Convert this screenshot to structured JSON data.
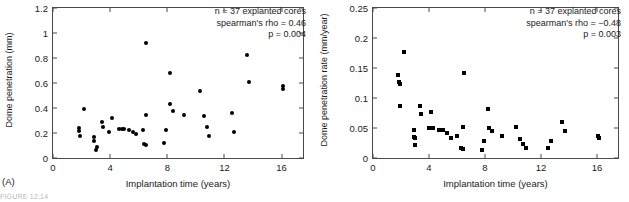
{
  "figure": {
    "caption_partial": "FIGURE 12.14"
  },
  "panels": [
    {
      "tag": "(A)",
      "xlabel": "Implantation time (years)",
      "ylabel": "Dome penetration (mm)",
      "stats": {
        "n_line": "n = 37 explanted cores",
        "rho_line": "spearman's rho = 0.46",
        "p_line": "p = 0.004"
      }
    },
    {
      "tag": "(B)",
      "xlabel": "Implantation time (years)",
      "ylabel": "Dome penetration rate (mm/year)",
      "stats": {
        "n_line": "n = 37 explanted cores",
        "rho_line": "spearman's rho = −0.48",
        "p_line": "p = 0.003"
      }
    }
  ],
  "chart_data": [
    {
      "type": "scatter",
      "panel": "A",
      "title": "",
      "xlabel": "Implantation time (years)",
      "ylabel": "Dome penetration (mm)",
      "xlim": [
        0,
        17.5
      ],
      "ylim": [
        0,
        1.2
      ],
      "xticks": [
        0,
        4,
        8,
        12,
        16
      ],
      "yticks": [
        0,
        0.2,
        0.4,
        0.6,
        0.8,
        1,
        1.2
      ],
      "ytick_labels": [
        "0",
        "0.2",
        "0.4",
        "0.6",
        "0.8",
        "1",
        "1.2"
      ],
      "grid": false,
      "marker": "circle",
      "marker_color": "#000000",
      "n": 37,
      "spearman_rho": 0.46,
      "p_value": 0.004,
      "points": [
        [
          1.8,
          0.24
        ],
        [
          1.8,
          0.22
        ],
        [
          1.9,
          0.175
        ],
        [
          2.2,
          0.395
        ],
        [
          2.9,
          0.165
        ],
        [
          2.9,
          0.14
        ],
        [
          3.0,
          0.065
        ],
        [
          3.1,
          0.085
        ],
        [
          3.4,
          0.29
        ],
        [
          3.5,
          0.245
        ],
        [
          3.9,
          0.205
        ],
        [
          4.1,
          0.32
        ],
        [
          4.6,
          0.23
        ],
        [
          4.8,
          0.235
        ],
        [
          5.0,
          0.23
        ],
        [
          5.3,
          0.225
        ],
        [
          5.6,
          0.205
        ],
        [
          5.8,
          0.19
        ],
        [
          6.3,
          0.225
        ],
        [
          6.4,
          0.115
        ],
        [
          6.5,
          0.105
        ],
        [
          6.5,
          0.345
        ],
        [
          7.8,
          0.12
        ],
        [
          7.9,
          0.225
        ],
        [
          8.2,
          0.43
        ],
        [
          8.2,
          0.68
        ],
        [
          8.4,
          0.375
        ],
        [
          6.5,
          0.92
        ],
        [
          9.2,
          0.345
        ],
        [
          10.3,
          0.54
        ],
        [
          10.6,
          0.335
        ],
        [
          10.8,
          0.245
        ],
        [
          10.9,
          0.18
        ],
        [
          12.5,
          0.36
        ],
        [
          12.7,
          0.21
        ],
        [
          13.6,
          0.825
        ],
        [
          13.7,
          0.61
        ],
        [
          16.1,
          0.58
        ],
        [
          16.1,
          0.55
        ]
      ]
    },
    {
      "type": "scatter",
      "panel": "B",
      "title": "",
      "xlabel": "Implantation time (years)",
      "ylabel": "Dome penetration rate (mm/year)",
      "xlim": [
        0,
        17.5
      ],
      "ylim": [
        0,
        0.25
      ],
      "xticks": [
        0,
        4,
        8,
        12,
        16
      ],
      "yticks": [
        0,
        0.05,
        0.1,
        0.15,
        0.2,
        0.25
      ],
      "ytick_labels": [
        "0",
        "0.05",
        "0.1",
        "0.15",
        "0.2",
        "0.25"
      ],
      "grid": false,
      "marker": "square",
      "marker_color": "#000000",
      "n": 37,
      "spearman_rho": -0.48,
      "p_value": 0.003,
      "points": [
        [
          1.8,
          0.138
        ],
        [
          1.85,
          0.127
        ],
        [
          1.9,
          0.124
        ],
        [
          1.95,
          0.087
        ],
        [
          2.2,
          0.176
        ],
        [
          2.9,
          0.047
        ],
        [
          2.95,
          0.035
        ],
        [
          3.0,
          0.033
        ],
        [
          3.0,
          0.022
        ],
        [
          3.35,
          0.086
        ],
        [
          3.4,
          0.074
        ],
        [
          4.0,
          0.05
        ],
        [
          4.15,
          0.077
        ],
        [
          4.3,
          0.05
        ],
        [
          4.7,
          0.046
        ],
        [
          5.0,
          0.046
        ],
        [
          5.3,
          0.042
        ],
        [
          5.6,
          0.033
        ],
        [
          6.0,
          0.037
        ],
        [
          6.3,
          0.016
        ],
        [
          6.4,
          0.015
        ],
        [
          6.45,
          0.052
        ],
        [
          6.5,
          0.142
        ],
        [
          7.8,
          0.014
        ],
        [
          7.9,
          0.029
        ],
        [
          8.2,
          0.081
        ],
        [
          8.3,
          0.05
        ],
        [
          8.5,
          0.045
        ],
        [
          9.2,
          0.037
        ],
        [
          10.2,
          0.052
        ],
        [
          10.5,
          0.031
        ],
        [
          10.7,
          0.023
        ],
        [
          10.9,
          0.016
        ],
        [
          12.5,
          0.017
        ],
        [
          12.7,
          0.028
        ],
        [
          13.5,
          0.06
        ],
        [
          13.7,
          0.045
        ],
        [
          16.05,
          0.036
        ],
        [
          16.15,
          0.034
        ]
      ]
    }
  ]
}
